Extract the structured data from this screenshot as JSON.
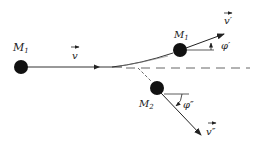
{
  "diagram": {
    "incoming": {
      "mass_label": "M",
      "mass_sub": "1",
      "velocity_label": "v"
    },
    "outgoing_1": {
      "mass_label": "M",
      "mass_sub": "1",
      "velocity_label": "v′",
      "angle_label": "φ′"
    },
    "outgoing_2": {
      "mass_label": "M",
      "mass_sub": "2",
      "velocity_label": "v″",
      "angle_label": "φ″"
    },
    "colors": {
      "ink": "#111111",
      "line": "#333333",
      "background": "#ffffff"
    }
  }
}
